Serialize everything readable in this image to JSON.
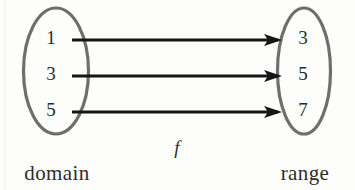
{
  "diagram": {
    "type": "function-mapping",
    "function_label": "f",
    "background_color": "#fdfdfc",
    "ellipse_stroke_color": "#6e6e6e",
    "arrow_color": "#151515",
    "text_color": "#2b2b2b",
    "domain": {
      "label": "domain",
      "elements": [
        "1",
        "3",
        "5"
      ]
    },
    "range": {
      "label": "range",
      "elements": [
        "3",
        "5",
        "7"
      ]
    },
    "mappings": [
      {
        "from": "1",
        "to": "3"
      },
      {
        "from": "3",
        "to": "5"
      },
      {
        "from": "5",
        "to": "7"
      }
    ]
  }
}
